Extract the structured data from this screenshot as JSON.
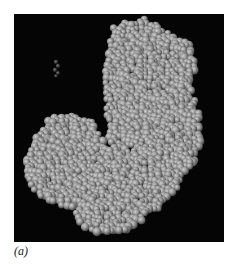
{
  "figure": {
    "panel_label": "(a)",
    "colors": {
      "background": "#050505",
      "atom_base": "#8c8c8c",
      "atom_highlight": "#c4c4c4",
      "atom_shadow": "#4a4a4a"
    }
  }
}
